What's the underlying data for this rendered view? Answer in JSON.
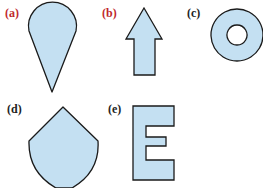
{
  "colors": {
    "fill": "#c4e0f2",
    "stroke": "#1a1a1a",
    "label_red": "#c0282d",
    "label_dark": "#222222"
  },
  "shapes": [
    {
      "id": "a",
      "label": "(a)",
      "shape": "teardrop",
      "label_color": "red"
    },
    {
      "id": "b",
      "label": "(b)",
      "shape": "up-arrow",
      "label_color": "red"
    },
    {
      "id": "c",
      "label": "(c)",
      "shape": "ring",
      "label_color": "dark"
    },
    {
      "id": "d",
      "label": "(d)",
      "shape": "shield",
      "label_color": "dark"
    },
    {
      "id": "e",
      "label": "(e)",
      "shape": "letter-E",
      "label_color": "dark"
    }
  ]
}
